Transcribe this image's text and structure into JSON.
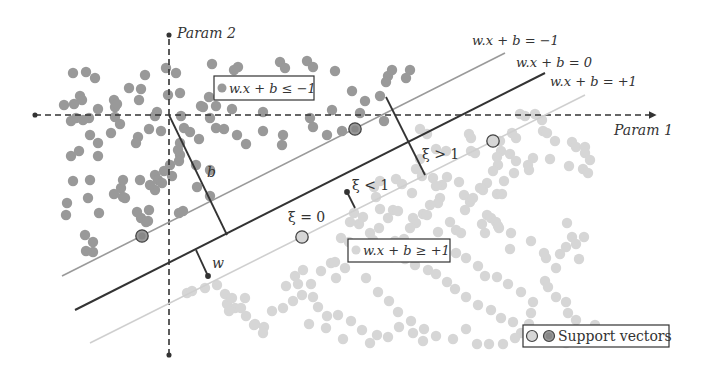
{
  "diagram": {
    "axes": {
      "x_label": "Param 1",
      "y_label": "Param 2",
      "origin": [
        169,
        115
      ]
    },
    "lines": [
      {
        "id": "margin-neg",
        "label": "w.x + b = −1",
        "color": "#9a9a9a",
        "x1": 62,
        "y1": 276,
        "x2": 505,
        "y2": 53
      },
      {
        "id": "hyperplane",
        "label": "w.x + b = 0",
        "color": "#333333",
        "x1": 75,
        "y1": 310,
        "x2": 545,
        "y2": 73
      },
      {
        "id": "margin-pos",
        "label": "w.x + b = +1",
        "color": "#cfcfcf",
        "x1": 90,
        "y1": 343,
        "x2": 585,
        "y2": 95
      }
    ],
    "annotations": {
      "b_label": "b",
      "w_label": "w",
      "xi_gt1": "ξ > 1",
      "xi_lt1": "ξ < 1",
      "xi_eq0": "ξ = 0"
    },
    "boxes": {
      "negative_class": "w.x + b ≤ −1",
      "positive_class": "w.x + b ≥ +1"
    },
    "legend": {
      "label": "Support vectors"
    },
    "colors": {
      "class_negative": "#999999",
      "class_positive": "#d6d6d6",
      "hyperplane": "#333333",
      "axis": "#333333"
    },
    "class_negative_points": [
      [
        73,
        73
      ],
      [
        86,
        72
      ],
      [
        95,
        78
      ],
      [
        145,
        75
      ],
      [
        166,
        68
      ],
      [
        176,
        73
      ],
      [
        212,
        64
      ],
      [
        238,
        67
      ],
      [
        234,
        70
      ],
      [
        280,
        62
      ],
      [
        285,
        68
      ],
      [
        307,
        61
      ],
      [
        313,
        67
      ],
      [
        335,
        71
      ],
      [
        64,
        105
      ],
      [
        74,
        104
      ],
      [
        82,
        100
      ],
      [
        80,
        96
      ],
      [
        98,
        109
      ],
      [
        115,
        107
      ],
      [
        114,
        100
      ],
      [
        117,
        104
      ],
      [
        129,
        88
      ],
      [
        141,
        89
      ],
      [
        139,
        100
      ],
      [
        168,
        95
      ],
      [
        180,
        93
      ],
      [
        209,
        97
      ],
      [
        203,
        107
      ],
      [
        201,
        106
      ],
      [
        216,
        106
      ],
      [
        232,
        109
      ],
      [
        263,
        112
      ],
      [
        332,
        110
      ],
      [
        352,
        91
      ],
      [
        388,
        76
      ],
      [
        386,
        82
      ],
      [
        392,
        70
      ],
      [
        410,
        70
      ],
      [
        406,
        78
      ],
      [
        71,
        121
      ],
      [
        76,
        118
      ],
      [
        89,
        118
      ],
      [
        83,
        120
      ],
      [
        90,
        135
      ],
      [
        71,
        156
      ],
      [
        79,
        151
      ],
      [
        111,
        133
      ],
      [
        115,
        117
      ],
      [
        120,
        124
      ],
      [
        138,
        137
      ],
      [
        136,
        143
      ],
      [
        149,
        129
      ],
      [
        157,
        112
      ],
      [
        155,
        116
      ],
      [
        161,
        131
      ],
      [
        181,
        116
      ],
      [
        184,
        128
      ],
      [
        190,
        132
      ],
      [
        199,
        139
      ],
      [
        210,
        118
      ],
      [
        216,
        128
      ],
      [
        224,
        129
      ],
      [
        237,
        135
      ],
      [
        246,
        144
      ],
      [
        263,
        131
      ],
      [
        283,
        135
      ],
      [
        282,
        145
      ],
      [
        310,
        118
      ],
      [
        313,
        127
      ],
      [
        327,
        135
      ],
      [
        342,
        131
      ],
      [
        365,
        101
      ],
      [
        360,
        113
      ],
      [
        380,
        96
      ],
      [
        384,
        121
      ],
      [
        66,
        215
      ],
      [
        67,
        203
      ],
      [
        99,
        213
      ],
      [
        88,
        198
      ],
      [
        114,
        194
      ],
      [
        125,
        198
      ],
      [
        121,
        188
      ],
      [
        123,
        197
      ],
      [
        141,
        218
      ],
      [
        146,
        222
      ],
      [
        149,
        210
      ],
      [
        155,
        190
      ],
      [
        155,
        175
      ],
      [
        158,
        180
      ],
      [
        162,
        183
      ],
      [
        164,
        171
      ],
      [
        150,
        185
      ],
      [
        137,
        212
      ],
      [
        148,
        221
      ],
      [
        179,
        213
      ],
      [
        183,
        211
      ],
      [
        197,
        187
      ],
      [
        210,
        196
      ],
      [
        180,
        155
      ],
      [
        179,
        161
      ],
      [
        210,
        170
      ],
      [
        98,
        156
      ],
      [
        98,
        143
      ],
      [
        73,
        181
      ],
      [
        85,
        235
      ],
      [
        93,
        252
      ],
      [
        86,
        251
      ],
      [
        93,
        242
      ],
      [
        90,
        180
      ],
      [
        123,
        180
      ],
      [
        140,
        180
      ],
      [
        172,
        176
      ],
      [
        170,
        165
      ],
      [
        196,
        165
      ],
      [
        178,
        150
      ],
      [
        180,
        143
      ]
    ],
    "class_positive_points": [
      [
        520,
        114
      ],
      [
        525,
        116
      ],
      [
        535,
        114
      ],
      [
        542,
        120
      ],
      [
        543,
        131
      ],
      [
        547,
        133
      ],
      [
        555,
        141
      ],
      [
        572,
        142
      ],
      [
        576,
        147
      ],
      [
        585,
        147
      ],
      [
        585,
        153
      ],
      [
        590,
        160
      ],
      [
        512,
        133
      ],
      [
        516,
        138
      ],
      [
        500,
        141
      ],
      [
        501,
        151
      ],
      [
        497,
        157
      ],
      [
        498,
        165
      ],
      [
        493,
        171
      ],
      [
        487,
        183
      ],
      [
        504,
        181
      ],
      [
        533,
        158
      ],
      [
        528,
        165
      ],
      [
        529,
        170
      ],
      [
        469,
        134
      ],
      [
        471,
        138
      ],
      [
        471,
        151
      ],
      [
        475,
        153
      ],
      [
        510,
        154
      ],
      [
        516,
        161
      ],
      [
        514,
        173
      ],
      [
        550,
        159
      ],
      [
        569,
        166
      ],
      [
        583,
        169
      ],
      [
        588,
        173
      ],
      [
        420,
        129
      ],
      [
        427,
        134
      ],
      [
        436,
        149
      ],
      [
        446,
        151
      ],
      [
        420,
        159
      ],
      [
        416,
        169
      ],
      [
        422,
        176
      ],
      [
        433,
        178
      ],
      [
        442,
        185
      ],
      [
        459,
        182
      ],
      [
        464,
        195
      ],
      [
        483,
        190
      ],
      [
        393,
        210
      ],
      [
        398,
        211
      ],
      [
        413,
        218
      ],
      [
        423,
        214
      ],
      [
        438,
        232
      ],
      [
        450,
        222
      ],
      [
        456,
        230
      ],
      [
        461,
        233
      ],
      [
        487,
        215
      ],
      [
        491,
        218
      ],
      [
        496,
        222
      ],
      [
        498,
        226
      ],
      [
        482,
        224
      ],
      [
        485,
        233
      ],
      [
        499,
        228
      ],
      [
        510,
        249
      ],
      [
        511,
        233
      ],
      [
        531,
        241
      ],
      [
        544,
        253
      ],
      [
        546,
        258
      ],
      [
        560,
        254
      ],
      [
        566,
        247
      ],
      [
        572,
        237
      ],
      [
        584,
        237
      ],
      [
        567,
        223
      ],
      [
        576,
        244
      ],
      [
        579,
        259
      ],
      [
        556,
        268
      ],
      [
        545,
        281
      ],
      [
        548,
        287
      ],
      [
        556,
        297
      ],
      [
        566,
        302
      ],
      [
        568,
        313
      ],
      [
        576,
        320
      ],
      [
        578,
        330
      ],
      [
        595,
        325
      ],
      [
        465,
        210
      ],
      [
        470,
        202
      ],
      [
        473,
        198
      ],
      [
        480,
        188
      ],
      [
        497,
        194
      ],
      [
        502,
        194
      ],
      [
        440,
        198
      ],
      [
        438,
        203
      ],
      [
        430,
        205
      ],
      [
        427,
        215
      ],
      [
        416,
        223
      ],
      [
        410,
        228
      ],
      [
        388,
        218
      ],
      [
        380,
        209
      ],
      [
        376,
        197
      ],
      [
        374,
        187
      ],
      [
        380,
        181
      ],
      [
        396,
        179
      ],
      [
        402,
        184
      ],
      [
        412,
        193
      ],
      [
        436,
        186
      ],
      [
        447,
        177
      ],
      [
        341,
        238
      ],
      [
        349,
        242
      ],
      [
        359,
        246
      ],
      [
        372,
        251
      ],
      [
        382,
        251
      ],
      [
        392,
        257
      ],
      [
        405,
        259
      ],
      [
        415,
        265
      ],
      [
        428,
        270
      ],
      [
        436,
        274
      ],
      [
        447,
        282
      ],
      [
        455,
        289
      ],
      [
        466,
        297
      ],
      [
        478,
        305
      ],
      [
        491,
        310
      ],
      [
        501,
        318
      ],
      [
        513,
        322
      ],
      [
        521,
        333
      ],
      [
        537,
        339
      ],
      [
        547,
        330
      ],
      [
        556,
        330
      ],
      [
        561,
        334
      ],
      [
        566,
        343
      ],
      [
        575,
        340
      ],
      [
        345,
        268
      ],
      [
        366,
        278
      ],
      [
        378,
        292
      ],
      [
        389,
        301
      ],
      [
        398,
        312
      ],
      [
        411,
        321
      ],
      [
        424,
        329
      ],
      [
        436,
        336
      ],
      [
        453,
        339
      ],
      [
        466,
        329
      ],
      [
        477,
        344
      ],
      [
        489,
        344
      ],
      [
        503,
        344
      ],
      [
        515,
        338
      ],
      [
        529,
        324
      ],
      [
        531,
        313
      ],
      [
        533,
        302
      ],
      [
        521,
        292
      ],
      [
        508,
        284
      ],
      [
        497,
        277
      ],
      [
        485,
        276
      ],
      [
        478,
        266
      ],
      [
        466,
        258
      ],
      [
        456,
        253
      ],
      [
        441,
        248
      ],
      [
        426,
        245
      ],
      [
        404,
        239
      ],
      [
        395,
        241
      ],
      [
        379,
        228
      ],
      [
        370,
        233
      ],
      [
        359,
        224
      ],
      [
        350,
        222
      ],
      [
        354,
        213
      ],
      [
        363,
        217
      ],
      [
        373,
        240
      ],
      [
        187,
        293
      ],
      [
        192,
        291
      ],
      [
        205,
        288
      ],
      [
        217,
        285
      ],
      [
        225,
        294
      ],
      [
        227,
        304
      ],
      [
        232,
        298
      ],
      [
        235,
        308
      ],
      [
        229,
        311
      ],
      [
        245,
        298
      ],
      [
        241,
        308
      ],
      [
        246,
        316
      ],
      [
        254,
        325
      ],
      [
        255,
        324
      ],
      [
        264,
        327
      ],
      [
        263,
        333
      ],
      [
        272,
        311
      ],
      [
        283,
        308
      ],
      [
        293,
        301
      ],
      [
        302,
        295
      ],
      [
        286,
        286
      ],
      [
        295,
        276
      ],
      [
        303,
        270
      ],
      [
        321,
        271
      ],
      [
        331,
        263
      ],
      [
        335,
        262
      ],
      [
        336,
        278
      ],
      [
        311,
        284
      ],
      [
        298,
        284
      ],
      [
        313,
        297
      ],
      [
        318,
        307
      ],
      [
        327,
        316
      ],
      [
        338,
        315
      ],
      [
        351,
        321
      ],
      [
        362,
        330
      ],
      [
        370,
        343
      ],
      [
        377,
        335
      ],
      [
        388,
        337
      ],
      [
        399,
        327
      ],
      [
        413,
        333
      ],
      [
        423,
        341
      ],
      [
        309,
        324
      ],
      [
        326,
        328
      ],
      [
        343,
        339
      ]
    ],
    "support_vectors_negative": [
      [
        355,
        129
      ],
      [
        142,
        236
      ]
    ],
    "support_vectors_positive": [
      [
        493,
        141
      ],
      [
        302,
        237
      ]
    ]
  }
}
